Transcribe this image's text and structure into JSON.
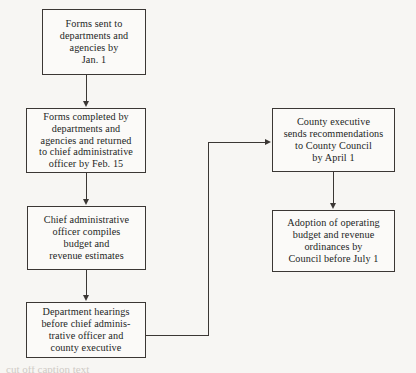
{
  "diagram": {
    "type": "flowchart",
    "orientation": "top-to-bottom with right branch",
    "background_color": "#f7f6f3",
    "line_color": "#3b3734",
    "text_color": "#231f1e",
    "nodes": [
      {
        "id": "forms-sent",
        "text": "Forms sent to\ndepartments and\nagencies by\nJan. 1",
        "column": "left",
        "order": 1
      },
      {
        "id": "forms-completed",
        "text": "Forms completed by\ndepartments and\nagencies and returned\nto chief administrative\nofficer by Feb. 15",
        "column": "left",
        "order": 2
      },
      {
        "id": "compiles",
        "text": "Chief administrative\nofficer compiles\nbudget and\nrevenue estimates",
        "column": "left",
        "order": 3
      },
      {
        "id": "hearings",
        "text": "Department hearings\nbefore chief adminis-\ntrative officer and\ncounty executive",
        "column": "left",
        "order": 4
      },
      {
        "id": "recommendations",
        "text": "County executive\nsends recommendations\nto County Council\nby April 1",
        "column": "right",
        "order": 5
      },
      {
        "id": "adoption",
        "text": "Adoption of operating\nbudget and revenue\nordinances by\nCouncil before July 1",
        "column": "right",
        "order": 6
      }
    ],
    "edges": [
      {
        "id": "e1",
        "from": "forms-sent",
        "to": "forms-completed",
        "style": "straight-down",
        "arrow": "down"
      },
      {
        "id": "e2",
        "from": "forms-completed",
        "to": "compiles",
        "style": "straight-down",
        "arrow": "down"
      },
      {
        "id": "e3",
        "from": "compiles",
        "to": "hearings",
        "style": "straight-down",
        "arrow": "down"
      },
      {
        "id": "e4",
        "from": "hearings",
        "to": "recommendations",
        "style": "elbow-right-up-right",
        "arrow": "right"
      },
      {
        "id": "e5",
        "from": "recommendations",
        "to": "adoption",
        "style": "straight-down",
        "arrow": "down"
      }
    ]
  },
  "page": {
    "caption_sliver": "cut off caption text"
  }
}
